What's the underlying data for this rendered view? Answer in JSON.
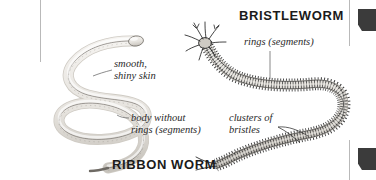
{
  "figure": {
    "ribbon_worm": {
      "title": "RIBBON WORM",
      "labels": {
        "smooth_skin_line1": "smooth,",
        "smooth_skin_line2": "shiny skin",
        "body_without_rings_line1": "body without",
        "body_without_rings_line2": "rings (segments)"
      }
    },
    "bristleworm": {
      "title": "BRISTLEWORM",
      "labels": {
        "rings_segments": "rings (segments)",
        "clusters_bristles_line1": "clusters of",
        "clusters_bristles_line2": "bristles"
      }
    },
    "colors": {
      "ink": "#1b1b1b",
      "label_ink": "#2a2a2a",
      "worm_fill": "#e9e7e3",
      "worm_shade": "#c9c5bf",
      "bristle_ink": "#2b2b2b",
      "rule": "#b9b9b9",
      "tab": "#3b3b3b",
      "background": "#ffffff"
    }
  }
}
